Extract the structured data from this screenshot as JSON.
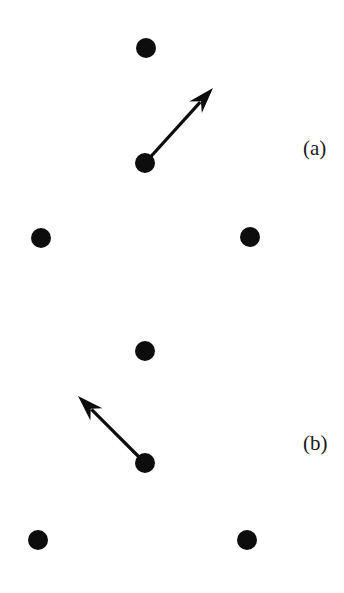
{
  "figure": {
    "width": 344,
    "height": 593,
    "background_color": "#ffffff",
    "ink_color": "#0d0d0d",
    "panels": [
      {
        "id": "a",
        "label": "(a)",
        "label_x": 303,
        "label_y": 138,
        "atoms": [
          {
            "name": "atom-a-top",
            "cx": 146,
            "cy": 48,
            "r": 10
          },
          {
            "name": "atom-a-center",
            "cx": 145,
            "cy": 163,
            "r": 10
          },
          {
            "name": "atom-a-lower-left",
            "cx": 41,
            "cy": 238,
            "r": 10
          },
          {
            "name": "atom-a-lower-right",
            "cx": 250,
            "cy": 237,
            "r": 10
          }
        ],
        "arrow": {
          "name": "displacement-arrow-a",
          "x1": 145,
          "y1": 163,
          "x2": 213,
          "y2": 88,
          "direction": "up-right",
          "shaft_width": 3.2,
          "head_length": 26,
          "head_half_width": 8.5,
          "head_notch": 8
        }
      },
      {
        "id": "b",
        "label": "(b)",
        "label_x": 303,
        "label_y": 433,
        "atoms": [
          {
            "name": "atom-b-top",
            "cx": 145,
            "cy": 351,
            "r": 10
          },
          {
            "name": "atom-b-center",
            "cx": 145,
            "cy": 463,
            "r": 10
          },
          {
            "name": "atom-b-lower-left",
            "cx": 38,
            "cy": 540,
            "r": 10
          },
          {
            "name": "atom-b-lower-right",
            "cx": 247,
            "cy": 540,
            "r": 10
          }
        ],
        "arrow": {
          "name": "displacement-arrow-b",
          "x1": 145,
          "y1": 463,
          "x2": 78,
          "y2": 396,
          "direction": "up-left",
          "shaft_width": 3.2,
          "head_length": 26,
          "head_half_width": 8.5,
          "head_notch": 8
        }
      }
    ]
  }
}
